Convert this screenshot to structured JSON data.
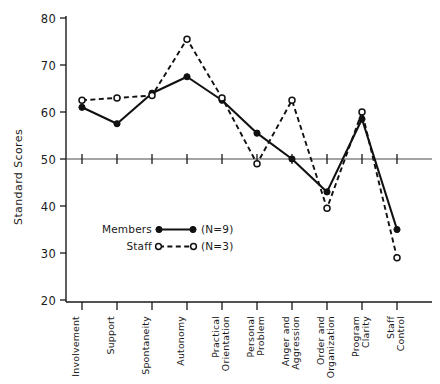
{
  "chart_data": {
    "type": "line",
    "title": "",
    "xlabel": "",
    "ylabel": "Standard Scores",
    "ylim": [
      20,
      80
    ],
    "yticks": [
      20,
      30,
      40,
      50,
      60,
      70,
      80
    ],
    "reference_line": 50,
    "grid": false,
    "legend_position": "inside-lower-left",
    "categories": [
      "Involvement",
      "Support",
      "Spontaneity",
      "Autonomy",
      "Practical Orientation",
      "Personal Problem",
      "Anger and Aggression",
      "Order and Organization",
      "Program Clarity",
      "Staff Control"
    ],
    "series": [
      {
        "name": "Members",
        "n_label": "(N=9)",
        "marker": "filled-circle",
        "line_style": "solid",
        "values": [
          61,
          57.5,
          64,
          67.5,
          62.5,
          55.5,
          50,
          43,
          58.5,
          35
        ]
      },
      {
        "name": "Staff",
        "n_label": "(N=3)",
        "marker": "open-circle",
        "line_style": "dashed",
        "values": [
          62.5,
          63,
          63.5,
          75.5,
          63,
          49,
          62.5,
          39.5,
          60,
          29
        ]
      }
    ]
  },
  "legend": {
    "entries": [
      {
        "label": "Members",
        "count": "(N=9)"
      },
      {
        "label": "Staff",
        "count": "(N=3)"
      }
    ]
  },
  "axis": {
    "y_title": "Standard Scores",
    "y_labels": [
      "80",
      "70",
      "60",
      "50",
      "40",
      "30",
      "20"
    ]
  },
  "colors": {
    "ink": "#111111",
    "reference": "#4a4a4a",
    "background": "#ffffff"
  }
}
